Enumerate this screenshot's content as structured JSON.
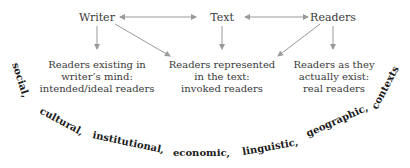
{
  "nodes": {
    "writer": "Writer",
    "text": "Text",
    "readers": "Readers"
  },
  "boxes": [
    {
      "lines": [
        "Readers existing in",
        "writer’s mind:",
        "intended/ideal readers"
      ]
    },
    {
      "lines": [
        "Readers represented",
        "in the text:",
        "invoked readers"
      ]
    },
    {
      "lines": [
        "Readers as they",
        "actually exist:",
        "real readers"
      ]
    }
  ],
  "contexts": [
    "social,",
    "cultural,",
    "institutional,",
    "economic,",
    "linguistic,",
    "geographic,",
    "contexts"
  ],
  "colors": {
    "arrow": "#9a9a9a",
    "text": "#3a3a3a",
    "context_text": "#1a1a1a"
  }
}
